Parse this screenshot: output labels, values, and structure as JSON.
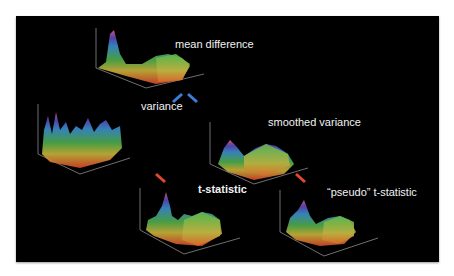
{
  "labels": {
    "mean_difference": "mean difference",
    "variance": "variance",
    "smoothed_variance": "smoothed variance",
    "t_statistic": "t-statistic",
    "pseudo_t_statistic": "“pseudo” t-statistic"
  },
  "colors": {
    "background": "#000000",
    "blue_arrow": "#3a7fd8",
    "red_arrow": "#e04a2a",
    "text": "#f2f2f2"
  },
  "icons": [
    "surface-plot",
    "arrow-blue",
    "arrow-red"
  ]
}
